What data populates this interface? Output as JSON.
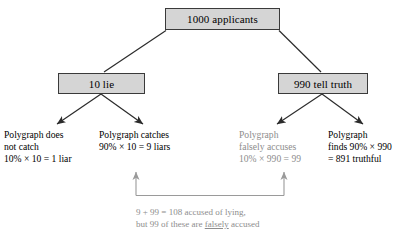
{
  "diagram": {
    "title_node": {
      "label": "1000 applicants"
    },
    "level2": [
      {
        "label": "10 lie"
      },
      {
        "label": "990 tell truth"
      }
    ],
    "leaves": [
      {
        "lines": [
          "Polygraph does",
          "not catch",
          "10% × 10 = 1 liar"
        ],
        "tone": "dark"
      },
      {
        "lines": [
          "Polygraph catches",
          "90% × 10 = 9 liars"
        ],
        "tone": "dark"
      },
      {
        "lines": [
          "Polygraph",
          "falsely accuses",
          "10% × 990 = 99"
        ],
        "tone": "muted"
      },
      {
        "lines": [
          "Polygraph",
          "finds 90% × 990",
          "= 891 truthful"
        ],
        "tone": "dark"
      }
    ],
    "summary": {
      "line1": "9 + 99 = 108 accused of lying,",
      "line2_prefix": "but 99 of these are ",
      "line2_underlined": "falsely",
      "line2_suffix": " accused"
    },
    "colors": {
      "box_fill": "#d5d5d5",
      "box_border": "#3a3a3a",
      "connector": "#2b2b2b",
      "muted_text": "#8d8d8d",
      "bracket": "#9a9a9a"
    }
  }
}
